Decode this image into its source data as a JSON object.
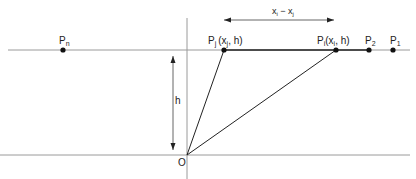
{
  "diagram": {
    "title": "",
    "labels": {
      "pn": "P",
      "pn_sub": "n",
      "pj": "P",
      "pj_sub": "j",
      "pj_coords": "(x",
      "pj_coords_sub": "j",
      "pj_coords_end": ", h)",
      "pi": "P",
      "pi_sub": "i",
      "pi_coords": "(x",
      "pi_coords_sub": "i",
      "pi_coords_end": ", h)",
      "p2": "P",
      "p2_sub": "2",
      "p1": "P",
      "p1_sub": "1",
      "distance_a": "x",
      "distance_a_sub": "i",
      "distance_minus": " − x",
      "distance_b_sub": "j",
      "height": "h",
      "origin": "O"
    },
    "points": [
      {
        "name": "Pn",
        "x": 63,
        "y": 50
      },
      {
        "name": "Pj",
        "x": 224,
        "y": 50
      },
      {
        "name": "Pi",
        "x": 336,
        "y": 50
      },
      {
        "name": "P2",
        "x": 369,
        "y": 50
      },
      {
        "name": "P1",
        "x": 393,
        "y": 50
      },
      {
        "name": "O",
        "x": 187,
        "y": 155
      }
    ],
    "colors": {
      "line": "#999999",
      "bold_line": "#222222",
      "point": "#111111"
    }
  }
}
